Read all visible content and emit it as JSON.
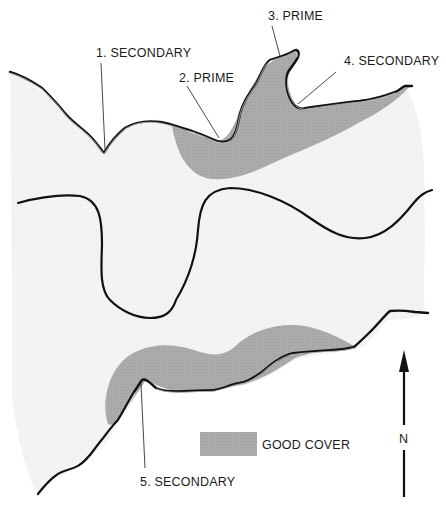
{
  "diagram": {
    "type": "map",
    "colors": {
      "background": "#ffffff",
      "water": "#f3f3f3",
      "good_cover": "#a9a9a9",
      "line": "#111111"
    },
    "labels": [
      {
        "id": "1",
        "text": "1. SECONDARY"
      },
      {
        "id": "2",
        "text": "2. PRIME"
      },
      {
        "id": "3",
        "text": "3. PRIME"
      },
      {
        "id": "4",
        "text": "4. SECONDARY"
      },
      {
        "id": "5",
        "text": "5. SECONDARY"
      }
    ],
    "legend": {
      "items": [
        {
          "symbol": "gray-fill-swatch",
          "label": "GOOD COVER"
        }
      ]
    },
    "north_arrow": {
      "label": "N"
    }
  }
}
